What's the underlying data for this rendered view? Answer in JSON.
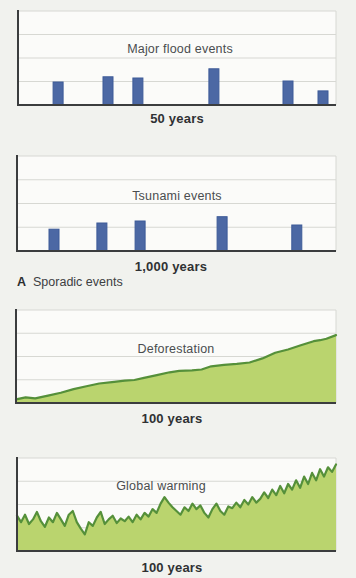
{
  "colors": {
    "page_bg": "#f1f2ee",
    "plot_bg": "#fbfbf9",
    "grid": "#d7d8d3",
    "axis": "#3b3d3e",
    "bar_fill": "#4c68a4",
    "bar_stroke": "#3d5a98",
    "area_fill": "#bad46e",
    "area_stroke": "#55903a"
  },
  "caption": {
    "letter": "A",
    "text": "Sporadic events"
  },
  "chart_data": [
    {
      "type": "bar",
      "title": "Major flood events",
      "xlabel": "50 years",
      "ylabel": "",
      "grid": true,
      "note": "schematic sporadic event chart; bar x = fraction of time axis, h = fraction of plot height",
      "bars": [
        {
          "x": 0.126,
          "h": 0.245
        },
        {
          "x": 0.283,
          "h": 0.3
        },
        {
          "x": 0.377,
          "h": 0.287
        },
        {
          "x": 0.616,
          "h": 0.385
        },
        {
          "x": 0.849,
          "h": 0.255
        },
        {
          "x": 0.959,
          "h": 0.15
        }
      ]
    },
    {
      "type": "bar",
      "title": "Tsunami events",
      "xlabel": "1,000 years",
      "ylabel": "",
      "grid": true,
      "note": "schematic sporadic event chart; bar x = fraction of time axis, h = fraction of plot height",
      "bars": [
        {
          "x": 0.116,
          "h": 0.23
        },
        {
          "x": 0.266,
          "h": 0.295
        },
        {
          "x": 0.386,
          "h": 0.316
        },
        {
          "x": 0.643,
          "h": 0.361
        },
        {
          "x": 0.877,
          "h": 0.274
        }
      ]
    },
    {
      "type": "area",
      "title": "Deforestation",
      "xlabel": "100 years",
      "ylabel": "",
      "grid": true,
      "note": "smooth rising trend; points are [fraction of time axis, fraction of plot height]",
      "points": [
        [
          0.0,
          0.04
        ],
        [
          0.03,
          0.06
        ],
        [
          0.06,
          0.05
        ],
        [
          0.1,
          0.08
        ],
        [
          0.14,
          0.11
        ],
        [
          0.18,
          0.15
        ],
        [
          0.22,
          0.18
        ],
        [
          0.26,
          0.21
        ],
        [
          0.3,
          0.225
        ],
        [
          0.34,
          0.24
        ],
        [
          0.37,
          0.247
        ],
        [
          0.4,
          0.27
        ],
        [
          0.44,
          0.3
        ],
        [
          0.48,
          0.33
        ],
        [
          0.51,
          0.345
        ],
        [
          0.55,
          0.35
        ],
        [
          0.58,
          0.36
        ],
        [
          0.61,
          0.395
        ],
        [
          0.65,
          0.41
        ],
        [
          0.69,
          0.42
        ],
        [
          0.73,
          0.435
        ],
        [
          0.77,
          0.48
        ],
        [
          0.81,
          0.54
        ],
        [
          0.85,
          0.575
        ],
        [
          0.89,
          0.62
        ],
        [
          0.93,
          0.665
        ],
        [
          0.95,
          0.675
        ],
        [
          0.97,
          0.69
        ],
        [
          1.0,
          0.73
        ]
      ]
    },
    {
      "type": "area",
      "title": "Global warming",
      "xlabel": "100 years",
      "ylabel": "",
      "grid": true,
      "note": "jagged noisy rising trend; values are fraction of plot height at evenly spaced x",
      "values": [
        0.38,
        0.31,
        0.39,
        0.29,
        0.34,
        0.42,
        0.32,
        0.26,
        0.36,
        0.31,
        0.41,
        0.34,
        0.27,
        0.39,
        0.43,
        0.31,
        0.24,
        0.18,
        0.31,
        0.27,
        0.36,
        0.42,
        0.29,
        0.34,
        0.38,
        0.3,
        0.35,
        0.32,
        0.37,
        0.31,
        0.39,
        0.34,
        0.41,
        0.37,
        0.45,
        0.41,
        0.51,
        0.58,
        0.52,
        0.47,
        0.43,
        0.39,
        0.47,
        0.43,
        0.51,
        0.45,
        0.49,
        0.41,
        0.36,
        0.45,
        0.51,
        0.43,
        0.39,
        0.48,
        0.46,
        0.52,
        0.47,
        0.55,
        0.5,
        0.58,
        0.52,
        0.56,
        0.63,
        0.57,
        0.66,
        0.6,
        0.7,
        0.62,
        0.72,
        0.66,
        0.76,
        0.68,
        0.8,
        0.72,
        0.84,
        0.76,
        0.88,
        0.8,
        0.9,
        0.85,
        0.93
      ]
    }
  ]
}
